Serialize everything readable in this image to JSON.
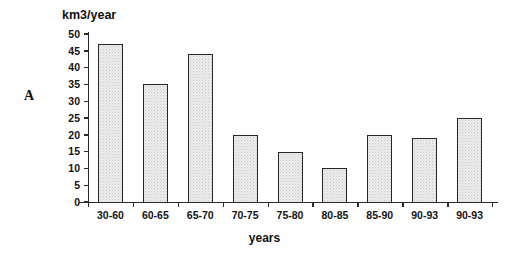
{
  "figure": {
    "panel_label": "A",
    "x_axis_title": "years",
    "y_axis_title": "km3/year"
  },
  "chart_data": {
    "type": "bar",
    "title": "",
    "xlabel": "years",
    "ylabel": "km3/year",
    "ylim": [
      0,
      50
    ],
    "ytick_step": 5,
    "yticks": [
      50,
      45,
      40,
      35,
      30,
      25,
      20,
      15,
      10,
      5,
      0
    ],
    "grid": false,
    "legend": false,
    "categories": [
      "30-60",
      "60-65",
      "65-70",
      "70-75",
      "75-80",
      "80-85",
      "85-90",
      "90-93",
      "90-93"
    ],
    "values": [
      47,
      35,
      44,
      20,
      15,
      10,
      20,
      19,
      25
    ],
    "bar_fill_color": "#ececec",
    "bar_edge_color": "#262626"
  }
}
